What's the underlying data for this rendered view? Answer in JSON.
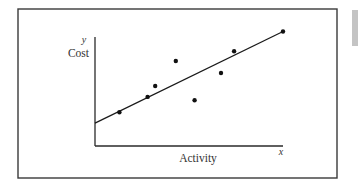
{
  "chart_data": {
    "type": "scatter",
    "title": "",
    "xlabel": "Activity",
    "ylabel": "Cost",
    "x_axis_symbol": "x",
    "y_axis_symbol": "y",
    "xlim": [
      0,
      10
    ],
    "ylim": [
      0,
      10
    ],
    "grid": false,
    "ticks": false,
    "legend": null,
    "series": [
      {
        "name": "Observations",
        "kind": "scatter",
        "points": [
          {
            "x": 1.3,
            "y": 3.1
          },
          {
            "x": 2.8,
            "y": 4.5
          },
          {
            "x": 3.2,
            "y": 5.5
          },
          {
            "x": 4.3,
            "y": 7.8
          },
          {
            "x": 5.3,
            "y": 4.2
          },
          {
            "x": 6.7,
            "y": 6.7
          },
          {
            "x": 7.4,
            "y": 8.7
          },
          {
            "x": 10.0,
            "y": 10.5
          }
        ]
      },
      {
        "name": "Regression line",
        "kind": "line",
        "points": [
          {
            "x": 0,
            "y": 2.1
          },
          {
            "x": 10.0,
            "y": 10.5
          }
        ]
      }
    ]
  },
  "labels": {
    "y_symbol": "y",
    "y_title": "Cost",
    "x_symbol": "x",
    "x_title": "Activity"
  },
  "render": {
    "origin_px": [
      95,
      146
    ],
    "x_axis_end_px": 283,
    "y_axis_top_px": 37,
    "px_per_unit_x": 18.8,
    "px_per_unit_y": 10.9
  }
}
